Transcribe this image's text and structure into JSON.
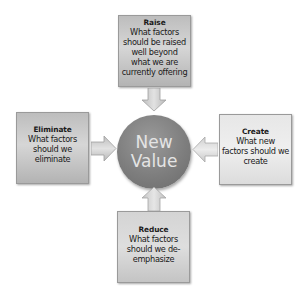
{
  "diagram": {
    "center": {
      "line1": "New",
      "line2": "Value"
    },
    "boxes": {
      "raise": {
        "title": "Raise",
        "lines": [
          "What factors",
          "should be raised",
          "well beyond",
          "what we are",
          "currently offering"
        ]
      },
      "eliminate": {
        "title": "Eliminate",
        "lines": [
          "What factors",
          "should we",
          "eliminate"
        ]
      },
      "create": {
        "title": "Create",
        "lines": [
          "What new",
          "factors should we",
          "create"
        ]
      },
      "reduce": {
        "title": "Reduce",
        "lines": [
          "What factors",
          "should we de-",
          "emphasize"
        ]
      }
    },
    "arrows": [
      {
        "from": "raise",
        "to": "center",
        "direction": "down"
      },
      {
        "from": "eliminate",
        "to": "center",
        "direction": "right"
      },
      {
        "from": "create",
        "to": "center",
        "direction": "left"
      },
      {
        "from": "reduce",
        "to": "center",
        "direction": "up"
      }
    ],
    "colors": {
      "circle": "#7e7e7e",
      "circle_text": "#e4e4e4",
      "dark_box": "#c4c4c4",
      "light_box": "#e7e7e7",
      "arrow": "#cfcfcf"
    }
  }
}
